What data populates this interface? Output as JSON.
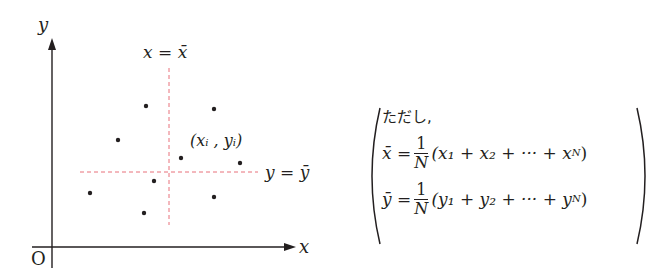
{
  "diagram": {
    "axes": {
      "x_label": "x",
      "y_label": "y",
      "origin_label": "O"
    },
    "mean_lines": {
      "vertical_label": "x = x̄",
      "horizontal_label": "y = ȳ",
      "color": "#e8707a"
    },
    "point_label": "(xᵢ , yᵢ)",
    "points": [
      {
        "x": 146,
        "y": 106
      },
      {
        "x": 214,
        "y": 109
      },
      {
        "x": 118,
        "y": 140
      },
      {
        "x": 181,
        "y": 158
      },
      {
        "x": 240,
        "y": 163
      },
      {
        "x": 154,
        "y": 181
      },
      {
        "x": 90,
        "y": 193
      },
      {
        "x": 214,
        "y": 197
      },
      {
        "x": 144,
        "y": 213
      }
    ]
  },
  "formula": {
    "note": "ただし,",
    "xbar_lhs": "x̄ =",
    "xbar_frac_num": "1",
    "xbar_frac_den": "N",
    "xbar_rhs": "(x₁ + x₂ + ··· + x",
    "xbar_sub_n": "N",
    "ybar_lhs": "ȳ =",
    "ybar_frac_num": "1",
    "ybar_frac_den": "N",
    "ybar_rhs": "(y₁ + y₂ + ··· + y",
    "ybar_sub_n": "N"
  }
}
